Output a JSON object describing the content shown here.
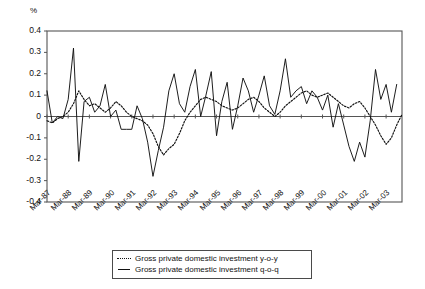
{
  "chart_data": {
    "type": "line",
    "title": "",
    "subtitle": "",
    "xlabel": "",
    "ylabel": "%",
    "unit_label": "%",
    "ylim": [
      -0.4,
      0.4
    ],
    "yticks": [
      "0.4",
      "0.3",
      "0.2",
      "0.1",
      "0",
      "-0.1",
      "-0.2",
      "-0.3",
      "-0.4"
    ],
    "ytick_values": [
      0.4,
      0.3,
      0.2,
      0.1,
      0,
      -0.1,
      -0.2,
      -0.3,
      -0.4
    ],
    "grid": false,
    "legend_position": "bottom-center",
    "x_tick_labels": [
      "Mar-87",
      "Mar-88",
      "Mar-89",
      "Mar-90",
      "Mar-91",
      "Mar-92",
      "Mar-93",
      "Mar-94",
      "Mar-95",
      "Mar-96",
      "Mar-97",
      "Mar-98",
      "Mar-99",
      "Mar-00",
      "Mar-01",
      "Mar-02",
      "Mar-03"
    ],
    "x_tick_quarter_index": [
      0,
      4,
      8,
      12,
      16,
      20,
      24,
      28,
      32,
      36,
      40,
      44,
      48,
      52,
      56,
      60,
      64
    ],
    "x_points_total": 68,
    "series": [
      {
        "name": "Gross private domestic investment y-o-y",
        "style": "dotted",
        "color": "#111111",
        "values": [
          -0.02,
          -0.03,
          -0.01,
          0.0,
          0.02,
          0.06,
          0.12,
          0.08,
          0.05,
          0.06,
          0.04,
          0.02,
          0.04,
          0.07,
          0.05,
          0.02,
          0.0,
          -0.01,
          -0.02,
          -0.04,
          -0.08,
          -0.14,
          -0.18,
          -0.15,
          -0.13,
          -0.08,
          -0.02,
          0.02,
          0.05,
          0.08,
          0.09,
          0.08,
          0.07,
          0.05,
          0.04,
          0.03,
          0.04,
          0.06,
          0.08,
          0.09,
          0.07,
          0.04,
          0.02,
          0.0,
          0.02,
          0.05,
          0.07,
          0.09,
          0.11,
          0.12,
          0.1,
          0.09,
          0.1,
          0.11,
          0.09,
          0.07,
          0.05,
          0.04,
          0.06,
          0.07,
          0.04,
          0.0,
          -0.04,
          -0.09,
          -0.13,
          -0.1,
          -0.04,
          0.01
        ]
      },
      {
        "name": "Gross private domestic investment q-o-q",
        "style": "solid",
        "color": "#111111",
        "values": [
          0.12,
          -0.03,
          0.0,
          -0.01,
          0.08,
          0.32,
          -0.21,
          0.07,
          0.09,
          0.02,
          0.05,
          0.15,
          0.0,
          0.03,
          -0.06,
          -0.06,
          -0.06,
          0.05,
          -0.01,
          -0.12,
          -0.28,
          -0.16,
          -0.05,
          0.12,
          0.2,
          0.06,
          0.02,
          0.14,
          0.22,
          0.0,
          0.1,
          0.21,
          -0.09,
          0.07,
          0.16,
          -0.06,
          0.05,
          0.18,
          0.12,
          0.02,
          0.1,
          0.19,
          0.05,
          0.01,
          0.12,
          0.27,
          0.09,
          0.12,
          0.14,
          0.06,
          0.12,
          0.09,
          0.03,
          0.1,
          -0.05,
          0.06,
          -0.04,
          -0.14,
          -0.21,
          -0.12,
          -0.19,
          -0.02,
          0.22,
          0.08,
          0.15,
          0.02,
          0.15
        ]
      }
    ],
    "legend": [
      {
        "label": "Gross private domestic investment y-o-y",
        "style": "dotted"
      },
      {
        "label": "Gross private domestic investment q-o-q",
        "style": "solid"
      }
    ],
    "axes": {
      "left_px": 47,
      "right_px": 402,
      "top_px": 31,
      "bottom_px": 202,
      "frame_color": "#555555",
      "zero_line": true
    }
  }
}
